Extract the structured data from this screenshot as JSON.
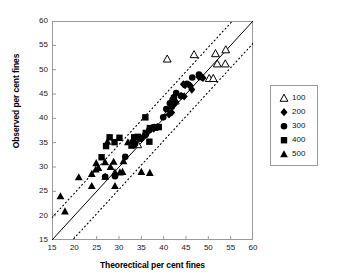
{
  "chart_data": {
    "type": "scatter",
    "title": "",
    "xlabel": "Theorectical per cent fines",
    "ylabel": "Observed per cent fines",
    "xlim": [
      15,
      60
    ],
    "ylim": [
      15,
      60
    ],
    "xticks": [
      15,
      20,
      25,
      30,
      35,
      40,
      45,
      50,
      55,
      60
    ],
    "yticks": [
      15,
      20,
      25,
      30,
      35,
      40,
      45,
      50,
      55,
      60
    ],
    "grid": false,
    "legend_position": "right-outside",
    "reference_lines": [
      {
        "name": "identity-line",
        "style": "solid",
        "slope": 1,
        "intercept": 0
      },
      {
        "name": "upper-band-line",
        "style": "dotted",
        "slope": 1,
        "intercept": 4.6
      },
      {
        "name": "lower-band-line",
        "style": "dotted",
        "slope": 1,
        "intercept": -4.6
      }
    ],
    "series": [
      {
        "name": "100",
        "marker": "open-triangle",
        "color": "#000000",
        "filled": false,
        "points": [
          [
            40.8,
            52.2
          ],
          [
            46.8,
            53.1
          ],
          [
            51.6,
            53.3
          ],
          [
            53.9,
            54.1
          ],
          [
            52.0,
            51.2
          ],
          [
            53.8,
            51.2
          ],
          [
            50.2,
            48.2
          ],
          [
            51.1,
            48.2
          ],
          [
            42.6,
            43.6
          ],
          [
            41.0,
            41.4
          ],
          [
            34.2,
            34.6
          ]
        ]
      },
      {
        "name": "200",
        "marker": "filled-diamond",
        "color": "#000000",
        "filled": true,
        "points": [
          [
            48.2,
            48.6
          ],
          [
            48.6,
            48.4
          ],
          [
            47.9,
            48.5
          ],
          [
            48.8,
            48.3
          ],
          [
            46.0,
            46.7
          ],
          [
            45.6,
            46.9
          ],
          [
            44.4,
            47.0
          ],
          [
            44.8,
            46.8
          ],
          [
            46.3,
            45.9
          ],
          [
            43.9,
            44.6
          ],
          [
            44.6,
            44.5
          ],
          [
            42.7,
            43.4
          ],
          [
            42.4,
            42.9
          ],
          [
            41.8,
            41.2
          ],
          [
            41.2,
            40.8
          ],
          [
            38.6,
            38.2
          ],
          [
            37.8,
            37.9
          ],
          [
            35.2,
            36.0
          ]
        ]
      },
      {
        "name": "300",
        "marker": "filled-circle",
        "color": "#000000",
        "filled": true,
        "points": [
          [
            47.9,
            49.0
          ],
          [
            46.4,
            48.4
          ],
          [
            45.2,
            47.1
          ],
          [
            43.9,
            44.6
          ],
          [
            42.8,
            45.2
          ],
          [
            42.3,
            44.3
          ],
          [
            42.0,
            43.8
          ],
          [
            41.4,
            43.1
          ],
          [
            41.8,
            42.4
          ],
          [
            40.6,
            41.9
          ],
          [
            39.9,
            40.2
          ],
          [
            38.7,
            38.2
          ],
          [
            37.9,
            38.2
          ],
          [
            36.8,
            37.6
          ],
          [
            35.9,
            36.6
          ],
          [
            34.8,
            35.8
          ],
          [
            33.6,
            34.8
          ],
          [
            33.2,
            34.5
          ],
          [
            31.4,
            32.1
          ],
          [
            29.1,
            28.1
          ],
          [
            26.9,
            28.0
          ]
        ]
      },
      {
        "name": "400",
        "marker": "filled-square",
        "color": "#000000",
        "filled": true,
        "points": [
          [
            38.9,
            38.2
          ],
          [
            37.9,
            38.1
          ],
          [
            36.9,
            38.0
          ],
          [
            36.0,
            37.0
          ],
          [
            35.9,
            40.2
          ],
          [
            36.8,
            35.2
          ],
          [
            34.2,
            36.2
          ],
          [
            33.4,
            36.1
          ],
          [
            33.1,
            35.0
          ],
          [
            32.8,
            34.4
          ],
          [
            30.1,
            36.0
          ],
          [
            29.0,
            35.1
          ],
          [
            27.9,
            36.1
          ],
          [
            27.1,
            34.3
          ],
          [
            26.1,
            32.0
          ]
        ]
      },
      {
        "name": "500",
        "marker": "filled-triangle",
        "color": "#000000",
        "filled": true,
        "points": [
          [
            16.9,
            24.0
          ],
          [
            17.9,
            20.9
          ],
          [
            21.0,
            27.9
          ],
          [
            23.9,
            28.6
          ],
          [
            24.8,
            29.5
          ],
          [
            25.4,
            29.8
          ],
          [
            23.9,
            26.1
          ],
          [
            26.9,
            31.0
          ],
          [
            24.9,
            30.8
          ],
          [
            26.9,
            28.0
          ],
          [
            28.8,
            31.1
          ],
          [
            29.1,
            28.9
          ],
          [
            30.2,
            28.9
          ],
          [
            30.8,
            29.0
          ],
          [
            29.1,
            26.1
          ],
          [
            31.0,
            31.2
          ],
          [
            33.2,
            34.9
          ],
          [
            36.9,
            28.8
          ],
          [
            35.0,
            29.0
          ],
          [
            27.4,
            35.2
          ],
          [
            32.0,
            35.1
          ],
          [
            28.1,
            30.0
          ]
        ]
      }
    ]
  },
  "legend": {
    "items": [
      {
        "label": "100",
        "marker": "open-triangle"
      },
      {
        "label": "200",
        "marker": "filled-diamond"
      },
      {
        "label": "300",
        "marker": "filled-circle"
      },
      {
        "label": "400",
        "marker": "filled-square"
      },
      {
        "label": "500",
        "marker": "filled-triangle"
      }
    ]
  }
}
